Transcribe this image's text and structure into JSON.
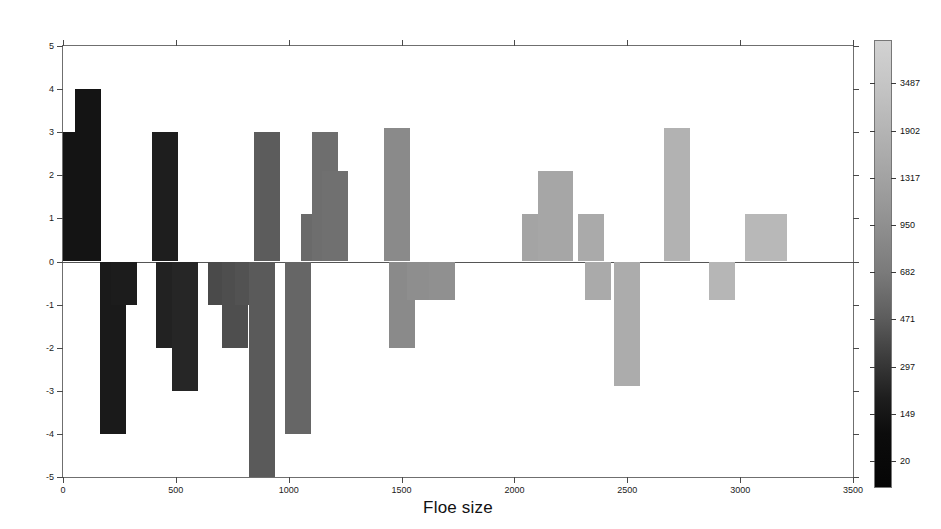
{
  "chart_data": {
    "type": "bar",
    "title": "",
    "subtitle": "",
    "xlabel": "Floe size",
    "ylabel": "Error differences",
    "xlim": [
      0,
      3500
    ],
    "ylim": [
      -5,
      5
    ],
    "xticks": [
      0,
      500,
      1000,
      1500,
      2000,
      2500,
      3000,
      3500
    ],
    "xticklabels": [
      "0",
      "500",
      "1000",
      "1500",
      "2000",
      "2500",
      "3000",
      "3500"
    ],
    "yticks": [
      -5,
      -4,
      -3,
      -2,
      -1,
      0,
      1,
      2,
      3,
      4,
      5
    ],
    "yticklabels": [
      "-5",
      "-4",
      "-3",
      "-2",
      "-1",
      "0",
      "1",
      "2",
      "3",
      "4",
      "5"
    ],
    "grid": false,
    "legend": "none",
    "colorbar": {
      "label": "",
      "orientation": "vertical",
      "position": "right",
      "low_color": "#050505",
      "high_color": "#d2d2d2",
      "ticks": [
        20,
        149,
        297,
        471,
        682,
        950,
        1317,
        1902,
        3487
      ],
      "ticklabels": [
        "20",
        "149",
        "297",
        "471",
        "682",
        "950",
        "1317",
        "1902",
        "3487"
      ]
    },
    "bar_width": 26,
    "x": [
      20,
      110,
      220,
      270,
      450,
      470,
      540,
      700,
      760,
      820,
      880,
      905,
      1040,
      1110,
      1160,
      1205,
      1480,
      1500,
      1580,
      1680,
      2090,
      2160,
      2200,
      2340,
      2370,
      2500,
      2720,
      2920,
      3080,
      3150
    ],
    "values": [
      3,
      4,
      -4,
      -1,
      3,
      -2,
      -3,
      -1,
      -2,
      -1,
      -5,
      3,
      -4,
      1.1,
      3,
      2.1,
      3.1,
      -2,
      -0.9,
      -0.9,
      1.1,
      2.1,
      2.1,
      1.1,
      -0.9,
      -2.9,
      3.1,
      -0.9,
      1.1,
      1.1
    ],
    "bar_colors": [
      "#141414",
      "#141414",
      "#1a1a1a",
      "#1c1c1c",
      "#1e1e1e",
      "#222222",
      "#262626",
      "#4a4a4a",
      "#4e4e4e",
      "#525252",
      "#5a5a5a",
      "#5c5c5c",
      "#666666",
      "#6a6a6a",
      "#6e6e6e",
      "#707070",
      "#8a8a8a",
      "#8a8a8a",
      "#8e8e8e",
      "#909090",
      "#a4a4a4",
      "#a6a6a6",
      "#a6a6a6",
      "#aaaaaa",
      "#aaaaaa",
      "#acacac",
      "#b2b2b2",
      "#b6b6b6",
      "#b8b8b8",
      "#b8b8b8"
    ]
  }
}
